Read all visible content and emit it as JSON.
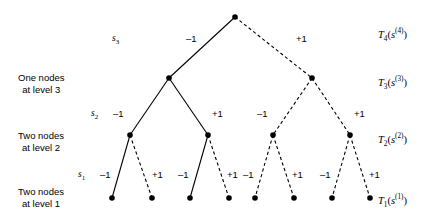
{
  "figure": {
    "background_color": "#ffffff",
    "line_color": "#000000",
    "width": 443,
    "height": 219
  },
  "row_labels": [
    {
      "name": "level-3-row-label",
      "line1": "One nodes",
      "line2": "at level 3",
      "x": 18,
      "y": 72
    },
    {
      "name": "level-2-row-label",
      "line1": "Two nodes",
      "line2": "at level 2",
      "x": 18,
      "y": 130
    },
    {
      "name": "level-1-row-label",
      "line1": "Two nodes",
      "line2": "at level 1",
      "x": 18,
      "y": 186
    }
  ],
  "stage_labels": [
    {
      "name": "stage-label-s3",
      "base": "s",
      "sub": "3",
      "x": 112,
      "y": 33
    },
    {
      "name": "stage-label-s2",
      "base": "s",
      "sub": "2",
      "x": 91,
      "y": 108
    },
    {
      "name": "stage-label-s1",
      "base": "s",
      "sub": "1",
      "x": 78,
      "y": 169
    }
  ],
  "value_labels": [
    {
      "name": "value-label-T4",
      "base": "T",
      "sub": "4",
      "arg_base": "s",
      "arg_sup": "(4)",
      "text": "T4(s(4))",
      "x": 378,
      "y": 26
    },
    {
      "name": "value-label-T3",
      "base": "T",
      "sub": "3",
      "arg_base": "s",
      "arg_sup": "(3)",
      "text": "T3(s(3))",
      "x": 378,
      "y": 74
    },
    {
      "name": "value-label-T2",
      "base": "T",
      "sub": "2",
      "arg_base": "s",
      "arg_sup": "(2)",
      "text": "T2(s(2))",
      "x": 378,
      "y": 131
    },
    {
      "name": "value-label-T1",
      "base": "T",
      "sub": "1",
      "arg_base": "s",
      "arg_sup": "(1)",
      "text": "T1(s(1))",
      "x": 378,
      "y": 192
    }
  ],
  "nodes": [
    {
      "id": "root",
      "level": 4,
      "x": 235,
      "y": 17,
      "r": 2.8
    },
    {
      "id": "n3L",
      "level": 3,
      "x": 169,
      "y": 78,
      "r": 2.8
    },
    {
      "id": "n3R",
      "level": 3,
      "x": 312,
      "y": 78,
      "r": 2.8
    },
    {
      "id": "n2a",
      "level": 2,
      "x": 130,
      "y": 135,
      "r": 2.8
    },
    {
      "id": "n2b",
      "level": 2,
      "x": 208,
      "y": 135,
      "r": 2.8
    },
    {
      "id": "n2c",
      "level": 2,
      "x": 273,
      "y": 135,
      "r": 2.8
    },
    {
      "id": "n2d",
      "level": 2,
      "x": 350,
      "y": 135,
      "r": 2.8
    },
    {
      "id": "l1",
      "level": 1,
      "x": 112,
      "y": 198,
      "r": 2.8
    },
    {
      "id": "l2",
      "level": 1,
      "x": 152,
      "y": 198,
      "r": 2.8
    },
    {
      "id": "l3",
      "level": 1,
      "x": 190,
      "y": 198,
      "r": 2.8
    },
    {
      "id": "l4",
      "level": 1,
      "x": 229,
      "y": 198,
      "r": 2.8
    },
    {
      "id": "l5",
      "level": 1,
      "x": 255,
      "y": 198,
      "r": 2.8
    },
    {
      "id": "l6",
      "level": 1,
      "x": 294,
      "y": 198,
      "r": 2.8
    },
    {
      "id": "l7",
      "level": 1,
      "x": 332,
      "y": 198,
      "r": 2.8
    },
    {
      "id": "l8",
      "level": 1,
      "x": 370,
      "y": 198,
      "r": 2.8
    }
  ],
  "edges": [
    {
      "name": "edge-root-left",
      "from": "root",
      "to": "n3L",
      "style": "solid",
      "action": "-1"
    },
    {
      "name": "edge-root-right",
      "from": "root",
      "to": "n3R",
      "style": "dashed",
      "action": "+1"
    },
    {
      "name": "edge-n3L-left",
      "from": "n3L",
      "to": "n2a",
      "style": "solid",
      "action": "-1"
    },
    {
      "name": "edge-n3L-right",
      "from": "n3L",
      "to": "n2b",
      "style": "solid",
      "action": "+1"
    },
    {
      "name": "edge-n3R-left",
      "from": "n3R",
      "to": "n2c",
      "style": "dashed",
      "action": "-1"
    },
    {
      "name": "edge-n3R-right",
      "from": "n3R",
      "to": "n2d",
      "style": "dashed",
      "action": "+1"
    },
    {
      "name": "edge-n2a-left",
      "from": "n2a",
      "to": "l1",
      "style": "solid",
      "action": "-1"
    },
    {
      "name": "edge-n2a-right",
      "from": "n2a",
      "to": "l2",
      "style": "dashed",
      "action": "+1"
    },
    {
      "name": "edge-n2b-left",
      "from": "n2b",
      "to": "l3",
      "style": "solid",
      "action": "-1"
    },
    {
      "name": "edge-n2b-right",
      "from": "n2b",
      "to": "l4",
      "style": "dashed",
      "action": "+1"
    },
    {
      "name": "edge-n2c-left",
      "from": "n2c",
      "to": "l5",
      "style": "dashed",
      "action": "-1"
    },
    {
      "name": "edge-n2c-right",
      "from": "n2c",
      "to": "l6",
      "style": "dashed",
      "action": "+1"
    },
    {
      "name": "edge-n2d-left",
      "from": "n2d",
      "to": "l7",
      "style": "dashed",
      "action": "-1"
    },
    {
      "name": "edge-n2d-right",
      "from": "n2d",
      "to": "l8",
      "style": "dashed",
      "action": "+1"
    }
  ],
  "edge_labels": [
    {
      "name": "edge-label-root-left",
      "text": "–1",
      "x": 186,
      "y": 33
    },
    {
      "name": "edge-label-root-right",
      "text": "+1",
      "x": 296,
      "y": 33
    },
    {
      "name": "edge-label-n3L-left",
      "text": "–1",
      "x": 113,
      "y": 108
    },
    {
      "name": "edge-label-n3L-right",
      "text": "+1",
      "x": 212,
      "y": 108
    },
    {
      "name": "edge-label-n3R-left",
      "text": "–1",
      "x": 257,
      "y": 108
    },
    {
      "name": "edge-label-n3R-right",
      "text": "+1",
      "x": 354,
      "y": 108
    },
    {
      "name": "edge-label-n2a-left",
      "text": "–1",
      "x": 100,
      "y": 169
    },
    {
      "name": "edge-label-n2a-right",
      "text": "+1",
      "x": 152,
      "y": 169
    },
    {
      "name": "edge-label-n2b-left",
      "text": "–1",
      "x": 178,
      "y": 169
    },
    {
      "name": "edge-label-n2b-right",
      "text": "+1",
      "x": 227,
      "y": 169
    },
    {
      "name": "edge-label-n2c-left",
      "text": "–1",
      "x": 243,
      "y": 169
    },
    {
      "name": "edge-label-n2c-right",
      "text": "+1",
      "x": 292,
      "y": 169
    },
    {
      "name": "edge-label-n2d-left",
      "text": "–1",
      "x": 320,
      "y": 169
    },
    {
      "name": "edge-label-n2d-right",
      "text": "+1",
      "x": 369,
      "y": 169
    }
  ]
}
